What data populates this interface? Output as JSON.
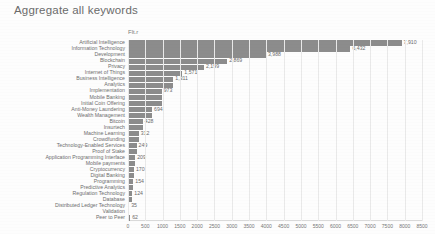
{
  "header": {
    "title": "Aggregate all keywords"
  },
  "chart_data": {
    "type": "bar",
    "orientation": "horizontal",
    "title": "Aggregate all keywords",
    "series_label": "Flt.r",
    "xlabel": "",
    "ylabel": "",
    "xlim": [
      0,
      8500
    ],
    "xticks": [
      0,
      500,
      1000,
      1500,
      2000,
      2500,
      3000,
      3500,
      4000,
      4500,
      5000,
      5500,
      6000,
      6500,
      7000,
      7500,
      8000,
      8500
    ],
    "xticklabels": [
      "0",
      "500",
      "1000",
      "1500",
      "2000",
      "2500",
      "3000",
      "3500",
      "4000",
      "4500",
      "5000",
      "5500",
      "6000",
      "6500",
      "7000",
      "7500",
      "8000",
      "8500"
    ],
    "grid": true,
    "legend": "none",
    "bar_color": "#8c8c8c",
    "categories": [
      "Artificial Intelligence",
      "Information Technology",
      "Development",
      "Blockchain",
      "Privacy",
      "Internet of Things",
      "Business Intelligence",
      "Analytics",
      "Implementation",
      "Mobile Banking",
      "Initial Coin Offering",
      "Anti-Money Laundering",
      "Wealth Management",
      "Bitcoin",
      "Insurtech",
      "Machine Learning",
      "Crowdfunding",
      "Technology-Enabled Services",
      "Proof of Stake",
      "Application Programming Interface",
      "Mobile payments",
      "Cryptocurrency",
      "Digital Banking",
      "Programming",
      "Predictive Analytics",
      "Regulation Technology",
      "Database",
      "Distributed Ledger Technology",
      "Validation",
      "Peer to Peer"
    ],
    "values": [
      7910,
      6432,
      3988,
      2869,
      2199,
      1571,
      1311,
      1311,
      973,
      973,
      973,
      694,
      694,
      428,
      428,
      312,
      312,
      249,
      249,
      209,
      209,
      170,
      170,
      154,
      154,
      124,
      124,
      35,
      35,
      62
    ],
    "value_labels": [
      "7,910",
      "6,432",
      "3,988",
      "2,869",
      "2,199",
      "1,571",
      "1,311",
      "",
      "973",
      "",
      "",
      "694",
      "",
      "428",
      "",
      "312",
      "",
      "249",
      "",
      "209",
      "",
      "170",
      "",
      "154",
      "",
      "124",
      "",
      "35",
      "",
      "62"
    ]
  }
}
